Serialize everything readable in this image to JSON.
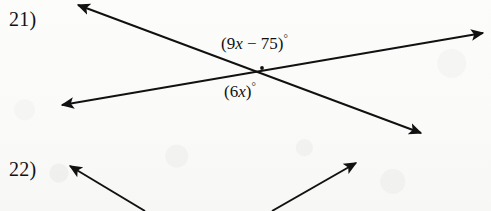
{
  "document": {
    "kind": "geometry-worksheet-scan",
    "width": 491,
    "height": 211,
    "background_color": "#fdfdfc",
    "ink_color": "#111111"
  },
  "problems": [
    {
      "number": "21)",
      "figure": "two-intersecting-lines",
      "labels": [
        {
          "name": "top-angle",
          "full_text": "(9x − 75)°",
          "open_paren": "(",
          "coefficient": "9",
          "variable": "x",
          "operator": "−",
          "constant": "75",
          "close_paren": ")",
          "degree": "°"
        },
        {
          "name": "bottom-angle",
          "full_text": "(6x)°",
          "open_paren": "(",
          "coefficient": "6",
          "variable": "x",
          "close_paren": ")",
          "degree": "°"
        }
      ],
      "lines": [
        {
          "name": "descending-line",
          "from": [
            78,
            5
          ],
          "to": [
            421,
            133
          ],
          "arrowheads": [
            "start",
            "end"
          ]
        },
        {
          "name": "ascending-line",
          "from": [
            62,
            105
          ],
          "to": [
            483,
            33
          ],
          "arrowheads": [
            "start",
            "end"
          ]
        }
      ],
      "intersection": [
        262,
        68
      ]
    },
    {
      "number": "22)",
      "figure": "two-rays-partial",
      "labels": [],
      "lines": [
        {
          "name": "left-ray",
          "from": [
            70,
            166
          ],
          "to": [
            145,
            211
          ],
          "arrowheads": [
            "start"
          ]
        },
        {
          "name": "right-ray",
          "from": [
            272,
            211
          ],
          "to": [
            356,
            163
          ],
          "arrowheads": [
            "end"
          ]
        }
      ]
    }
  ]
}
